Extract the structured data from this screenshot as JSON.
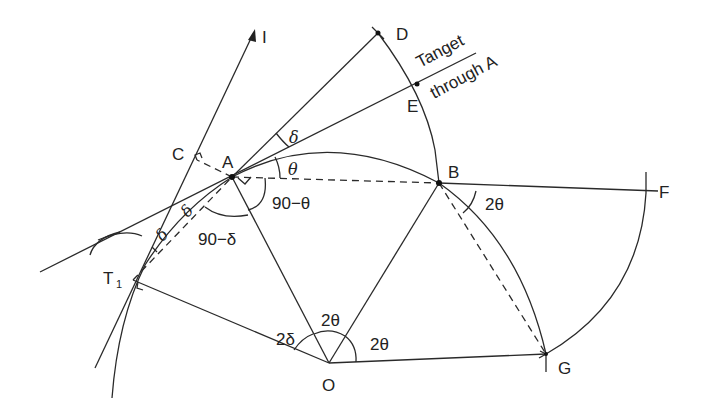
{
  "diagram": {
    "points": {
      "A": {
        "label": "A",
        "x": 232,
        "y": 177
      },
      "B": {
        "label": "B",
        "x": 439,
        "y": 183
      },
      "C": {
        "label": "C",
        "x": 197,
        "y": 160
      },
      "D": {
        "label": "D",
        "x": 378,
        "y": 33
      },
      "E": {
        "label": "E",
        "x": 417,
        "y": 84
      },
      "F": {
        "label": "F",
        "x": 658,
        "y": 191
      },
      "G": {
        "label": "G",
        "x": 546,
        "y": 354
      },
      "O": {
        "label": "O",
        "x": 329,
        "y": 363
      },
      "T1": {
        "label": "T",
        "subscript": "1",
        "x": 133,
        "y": 280
      },
      "I": {
        "label": "I",
        "x": 255,
        "y": 30
      }
    },
    "annotations": {
      "tangent_line1": "Tanget",
      "tangent_line2": "through A",
      "delta_top": "δ",
      "theta_at_A": "θ",
      "ninety_minus_theta": "90−θ",
      "ninety_minus_delta": "90−δ",
      "delta_left1": "δ",
      "delta_left2": "δ",
      "two_delta_O": "2δ",
      "two_theta_O": "2θ",
      "two_theta_O2": "2θ",
      "two_theta_B": "2θ"
    }
  }
}
